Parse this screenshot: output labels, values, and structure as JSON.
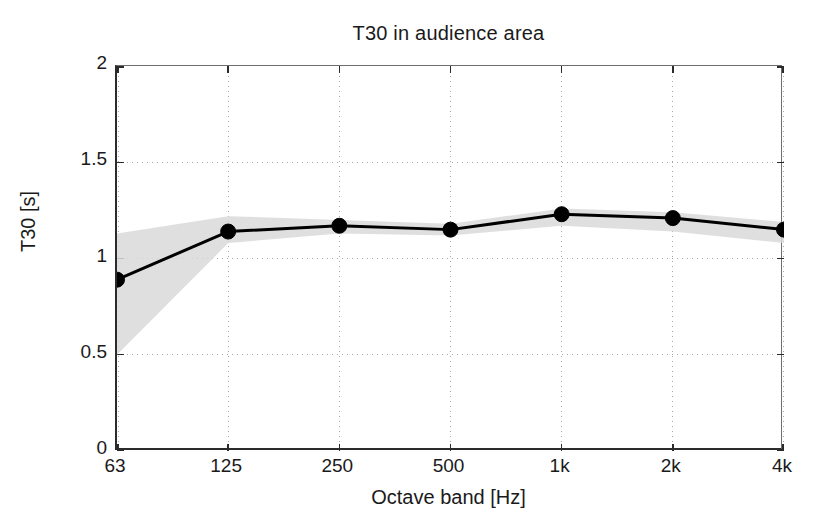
{
  "chart_data": {
    "type": "line",
    "title": "T30 in audience area",
    "xlabel": "Octave band [Hz]",
    "ylabel": "T30 [s]",
    "categories": [
      "63",
      "125",
      "250",
      "500",
      "1k",
      "2k",
      "4k"
    ],
    "ytick_labels": [
      "0",
      "0.5",
      "1",
      "1.5",
      "2"
    ],
    "ytick_values": [
      0,
      0.5,
      1,
      1.5,
      2
    ],
    "ylim": [
      0,
      2
    ],
    "grid": "dotted",
    "legend": "none",
    "series": [
      {
        "name": "T30 mean",
        "values": [
          0.89,
          1.14,
          1.17,
          1.15,
          1.23,
          1.21,
          1.15
        ],
        "color": "#000000",
        "marker": "filled-circle"
      }
    ],
    "band": {
      "name": "spatial spread",
      "color": "#d9d9d9",
      "lower": [
        0.5,
        1.08,
        1.13,
        1.12,
        1.17,
        1.14,
        1.08
      ],
      "upper": [
        1.13,
        1.22,
        1.2,
        1.18,
        1.26,
        1.24,
        1.19
      ]
    }
  },
  "axes": {
    "y_ticks": [
      {
        "label": "2",
        "value": 2
      },
      {
        "label": "1.5",
        "value": 1.5
      },
      {
        "label": "1",
        "value": 1
      },
      {
        "label": "0.5",
        "value": 0.5
      },
      {
        "label": "0",
        "value": 0
      }
    ],
    "x_ticks": [
      {
        "label": "63",
        "index": 0
      },
      {
        "label": "125",
        "index": 1
      },
      {
        "label": "250",
        "index": 2
      },
      {
        "label": "500",
        "index": 3
      },
      {
        "label": "1k",
        "index": 4
      },
      {
        "label": "2k",
        "index": 5
      },
      {
        "label": "4k",
        "index": 6
      }
    ]
  }
}
